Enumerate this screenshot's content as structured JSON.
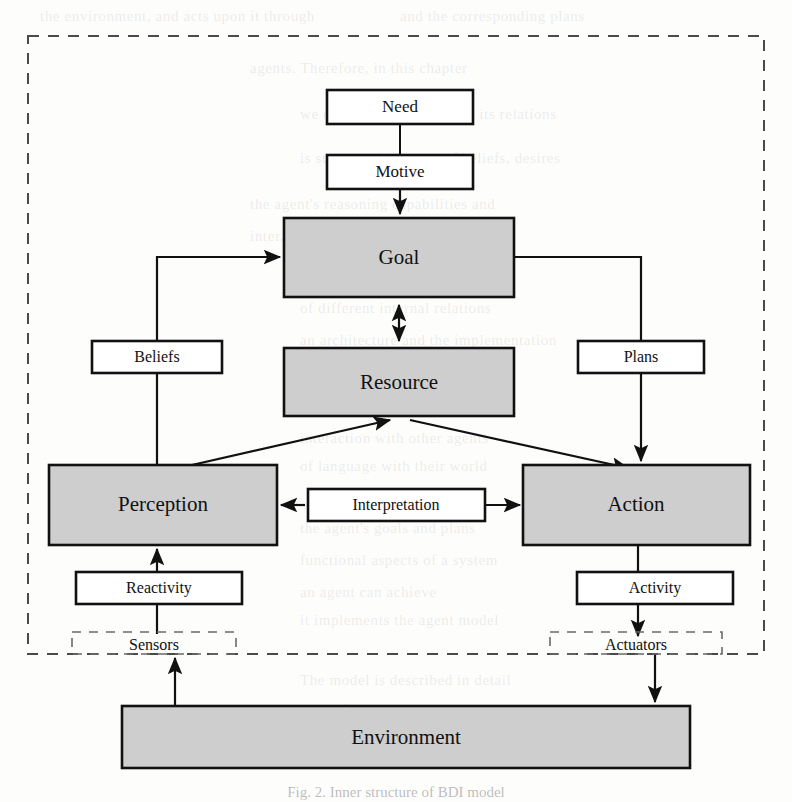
{
  "figure": {
    "caption": "Fig. 2.  Inner structure of BDI model",
    "boundary_label": "agent-boundary"
  },
  "colors": {
    "shaded_fill": "#cecece",
    "box_stroke": "#111111",
    "white_fill": "#ffffff",
    "dashed_stroke": "#4a4a4a",
    "page_background": "#fdfdfc"
  },
  "nodes": {
    "need": {
      "label": "Need",
      "style": "white",
      "x": 327,
      "y": 90,
      "w": 146,
      "h": 34
    },
    "motive": {
      "label": "Motive",
      "style": "white",
      "x": 327,
      "y": 155,
      "w": 146,
      "h": 34
    },
    "goal": {
      "label": "Goal",
      "style": "shaded",
      "x": 284,
      "y": 218,
      "w": 230,
      "h": 79
    },
    "resource": {
      "label": "Resource",
      "style": "shaded",
      "x": 284,
      "y": 348,
      "w": 230,
      "h": 68
    },
    "beliefs": {
      "label": "Beliefs",
      "style": "white",
      "x": 92,
      "y": 341,
      "w": 130,
      "h": 32
    },
    "plans": {
      "label": "Plans",
      "style": "white",
      "x": 578,
      "y": 341,
      "w": 126,
      "h": 32
    },
    "perception": {
      "label": "Perception",
      "style": "shaded",
      "x": 49,
      "y": 465,
      "w": 228,
      "h": 80
    },
    "interpretation": {
      "label": "Interpretation",
      "style": "white",
      "x": 308,
      "y": 489,
      "w": 177,
      "h": 32
    },
    "action": {
      "label": "Action",
      "style": "shaded",
      "x": 523,
      "y": 465,
      "w": 227,
      "h": 80
    },
    "reactivity": {
      "label": "Reactivity",
      "style": "white",
      "x": 76,
      "y": 572,
      "w": 166,
      "h": 32
    },
    "activity": {
      "label": "Activity",
      "style": "white",
      "x": 577,
      "y": 572,
      "w": 156,
      "h": 32
    },
    "sensors": {
      "label": "Sensors",
      "style": "dashed",
      "x": 72,
      "y": 632,
      "w": 164,
      "h": 22
    },
    "actuators": {
      "label": "Actuators",
      "style": "dashed",
      "x": 550,
      "y": 632,
      "w": 172,
      "h": 22
    },
    "environment": {
      "label": "Environment",
      "style": "shaded",
      "x": 122,
      "y": 706,
      "w": 568,
      "h": 62
    }
  },
  "boundary": {
    "x": 28,
    "y": 36,
    "w": 736,
    "h": 618
  },
  "edges": [
    {
      "name": "need-to-motive",
      "from": "need",
      "to": "motive",
      "arrow": "none"
    },
    {
      "name": "motive-to-goal",
      "from": "motive",
      "to": "goal",
      "arrow": "end"
    },
    {
      "name": "goal-to-resource",
      "from": "goal",
      "to": "resource",
      "arrow": "both"
    },
    {
      "name": "beliefs-to-goal",
      "from": "beliefs",
      "to": "goal",
      "arrow": "end"
    },
    {
      "name": "goal-to-plans",
      "from": "goal",
      "to": "plans",
      "arrow": "none"
    },
    {
      "name": "plans-to-action",
      "from": "plans",
      "to": "action",
      "arrow": "end"
    },
    {
      "name": "perception-to-beliefs",
      "from": "perception",
      "to": "beliefs",
      "arrow": "none"
    },
    {
      "name": "perception-to-resource",
      "from": "perception",
      "to": "resource",
      "arrow": "end"
    },
    {
      "name": "resource-to-action",
      "from": "resource",
      "to": "action",
      "arrow": "end"
    },
    {
      "name": "interpretation-to-perception",
      "from": "interpretation",
      "to": "perception",
      "arrow": "end"
    },
    {
      "name": "interpretation-to-action",
      "from": "interpretation",
      "to": "action",
      "arrow": "end"
    },
    {
      "name": "reactivity-to-perception",
      "from": "reactivity",
      "to": "perception",
      "arrow": "end"
    },
    {
      "name": "sensors-to-reactivity",
      "from": "sensors",
      "to": "reactivity",
      "arrow": "none"
    },
    {
      "name": "action-to-activity",
      "from": "action",
      "to": "activity",
      "arrow": "none"
    },
    {
      "name": "activity-to-actuators",
      "from": "activity",
      "to": "actuators",
      "arrow": "end"
    },
    {
      "name": "environment-to-sensors",
      "from": "environment",
      "to": "sensors",
      "arrow": "end"
    },
    {
      "name": "actuators-to-environment",
      "from": "actuators",
      "to": "environment",
      "arrow": "end"
    }
  ],
  "bleed_text": [
    {
      "t": "the environment, and acts upon it through",
      "x": 40,
      "y": 8
    },
    {
      "t": "and the corresponding plans",
      "x": 400,
      "y": 8
    },
    {
      "t": "agents. Therefore, in this chapter",
      "x": 250,
      "y": 60
    },
    {
      "t": "we describe the model and its relations",
      "x": 300,
      "y": 106
    },
    {
      "t": "is structured in terms of beliefs, desires",
      "x": 300,
      "y": 150
    },
    {
      "t": "the agent's reasoning capabilities and",
      "x": 250,
      "y": 196
    },
    {
      "t": "interaction with the",
      "x": 250,
      "y": 228
    },
    {
      "t": "of influencing agent behaviour",
      "x": 300,
      "y": 268
    },
    {
      "t": "of different internal relations",
      "x": 300,
      "y": 300
    },
    {
      "t": "an architecture and the implementation",
      "x": 300,
      "y": 332
    },
    {
      "t": "of the agents that populate it",
      "x": 300,
      "y": 364
    },
    {
      "t": "a diagram model of the structure",
      "x": 300,
      "y": 400
    },
    {
      "t": "interaction with other agents",
      "x": 300,
      "y": 430
    },
    {
      "t": "of language with their world",
      "x": 300,
      "y": 458
    },
    {
      "t": "the agent's goals and plans",
      "x": 300,
      "y": 520
    },
    {
      "t": "functional aspects of a system",
      "x": 300,
      "y": 552
    },
    {
      "t": "an agent can achieve",
      "x": 300,
      "y": 584
    },
    {
      "t": "it implements the agent model",
      "x": 300,
      "y": 612
    },
    {
      "t": "The model is described in detail",
      "x": 300,
      "y": 672
    },
    {
      "t": "in the following section",
      "x": 300,
      "y": 702
    }
  ]
}
